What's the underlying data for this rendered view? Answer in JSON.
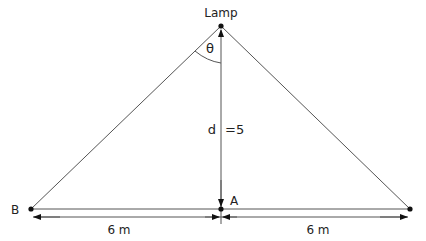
{
  "diagram": {
    "labels": {
      "lamp": "Lamp",
      "theta": "θ",
      "d": "d",
      "d_value": "=5",
      "point_b": "B",
      "point_a": "A",
      "left_distance": "6 m",
      "right_distance": "6 m"
    },
    "colors": {
      "line": "#555555",
      "point": "#111111",
      "text": "#222222"
    }
  }
}
